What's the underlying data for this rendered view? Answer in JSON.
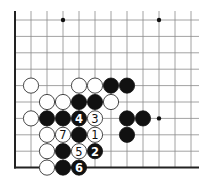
{
  "diagram": {
    "type": "go-board-fragment",
    "corner": "bottom-left",
    "columns_visible": 13,
    "rows_visible": 10,
    "star_points": [
      {
        "col": 3,
        "row": 0
      },
      {
        "col": 9,
        "row": 0
      },
      {
        "col": 9,
        "row": 6
      }
    ],
    "stones": [
      {
        "color": "white",
        "col": 1,
        "row": 4,
        "label": ""
      },
      {
        "color": "white",
        "col": 4,
        "row": 4,
        "label": ""
      },
      {
        "color": "white",
        "col": 5,
        "row": 4,
        "label": ""
      },
      {
        "color": "black",
        "col": 6,
        "row": 4,
        "label": ""
      },
      {
        "color": "black",
        "col": 7,
        "row": 4,
        "label": ""
      },
      {
        "color": "white",
        "col": 2,
        "row": 5,
        "label": ""
      },
      {
        "color": "white",
        "col": 3,
        "row": 5,
        "label": ""
      },
      {
        "color": "black",
        "col": 4,
        "row": 5,
        "label": ""
      },
      {
        "color": "black",
        "col": 5,
        "row": 5,
        "label": ""
      },
      {
        "color": "white",
        "col": 6,
        "row": 5,
        "label": ""
      },
      {
        "color": "white",
        "col": 1,
        "row": 6,
        "label": ""
      },
      {
        "color": "black",
        "col": 2,
        "row": 6,
        "label": ""
      },
      {
        "color": "black",
        "col": 3,
        "row": 6,
        "label": ""
      },
      {
        "color": "black",
        "col": 4,
        "row": 6,
        "label": "4"
      },
      {
        "color": "white",
        "col": 5,
        "row": 6,
        "label": "3"
      },
      {
        "color": "black",
        "col": 7,
        "row": 6,
        "label": ""
      },
      {
        "color": "black",
        "col": 8,
        "row": 6,
        "label": ""
      },
      {
        "color": "white",
        "col": 2,
        "row": 7,
        "label": ""
      },
      {
        "color": "white",
        "col": 3,
        "row": 7,
        "label": "7"
      },
      {
        "color": "black",
        "col": 4,
        "row": 7,
        "label": ""
      },
      {
        "color": "white",
        "col": 5,
        "row": 7,
        "label": "1"
      },
      {
        "color": "black",
        "col": 7,
        "row": 7,
        "label": ""
      },
      {
        "color": "white",
        "col": 2,
        "row": 8,
        "label": ""
      },
      {
        "color": "black",
        "col": 3,
        "row": 8,
        "label": ""
      },
      {
        "color": "white",
        "col": 4,
        "row": 8,
        "label": "5"
      },
      {
        "color": "black",
        "col": 5,
        "row": 8,
        "label": "2"
      },
      {
        "color": "white",
        "col": 2,
        "row": 9,
        "label": ""
      },
      {
        "color": "black",
        "col": 3,
        "row": 9,
        "label": ""
      },
      {
        "color": "black",
        "col": 4,
        "row": 9,
        "label": "6"
      }
    ]
  }
}
